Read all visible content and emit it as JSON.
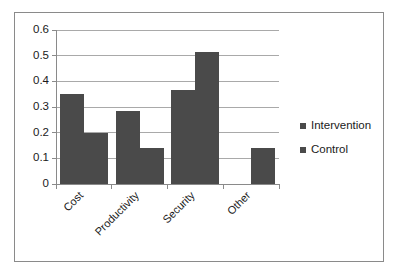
{
  "chart_data": {
    "type": "bar",
    "title": "",
    "subtitle": "",
    "xlabel": "",
    "ylabel": "",
    "categories": [
      "Cost",
      "Productivity",
      "Security",
      "Other"
    ],
    "series": [
      {
        "name": "Intervention",
        "values": [
          0.35,
          0.285,
          0.365,
          0
        ]
      },
      {
        "name": "Control",
        "values": [
          0.2,
          0.14,
          0.515,
          0.14
        ]
      }
    ],
    "ylim": [
      0,
      0.6
    ],
    "ytick_labels": [
      "0",
      "0.1",
      "0.2",
      "0.3",
      "0.4",
      "0.5",
      "0.6"
    ],
    "ytick_values": [
      0,
      0.1,
      0.2,
      0.3,
      0.4,
      0.5,
      0.6
    ],
    "grid": true,
    "grid_axis": "y",
    "legend_position": "right",
    "xtick_label_rotation": 45,
    "bar_color": "#4a4a4a",
    "gridline_color": "#a9a9a9",
    "axis_color": "#8a8a8a",
    "border_color": "#8a8a8a",
    "background_color": "#ffffff",
    "text_color": "#1a1a1a"
  },
  "legend": {
    "items": [
      {
        "label": "Intervention",
        "marker": "square-marker",
        "color": "#4a4a4a"
      },
      {
        "label": "Control",
        "marker": "square-marker",
        "color": "#4a4a4a"
      }
    ]
  }
}
